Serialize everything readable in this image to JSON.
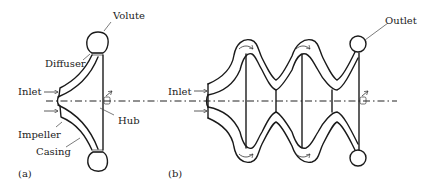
{
  "figure": {
    "panel_a": {
      "tag": "(a)",
      "labels": {
        "volute": "Volute",
        "diffuser": "Diffuser",
        "inlet": "Inlet",
        "impeller": "Impeller",
        "casing": "Casing",
        "hub": "Hub"
      }
    },
    "panel_b": {
      "tag": "(b)",
      "labels": {
        "inlet": "Inlet",
        "outlet": "Outlet"
      }
    }
  }
}
